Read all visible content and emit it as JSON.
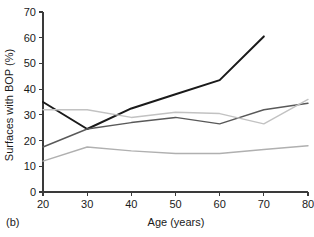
{
  "panel": {
    "label": "(b)"
  },
  "chart_data": {
    "type": "line",
    "title": "",
    "xlabel": "Age (years)",
    "ylabel": "Surfaces with BOP (%)",
    "xlim": [
      20,
      80
    ],
    "ylim": [
      0,
      70
    ],
    "xticks": [
      20,
      30,
      40,
      50,
      60,
      70,
      80
    ],
    "xtick_labels": [
      "20",
      "30",
      "40",
      "50",
      "60",
      "70",
      "80"
    ],
    "yticks": [
      0,
      10,
      20,
      30,
      40,
      50,
      60,
      70
    ],
    "ytick_labels": [
      "0",
      "10",
      "20",
      "30",
      "40",
      "50",
      "60",
      "70"
    ],
    "grid": false,
    "legend": "none",
    "series": [
      {
        "name": "series-1-black",
        "color": "#1a1a1a",
        "width": 2.0,
        "x": [
          20,
          30,
          40,
          50,
          60,
          70
        ],
        "values": [
          35.0,
          24.5,
          32.5,
          38.0,
          43.5,
          60.5
        ]
      },
      {
        "name": "series-2-dark-gray",
        "color": "#595959",
        "width": 1.4,
        "x": [
          20,
          30,
          40,
          50,
          60,
          70,
          80
        ],
        "values": [
          17.5,
          24.5,
          27.0,
          29.0,
          26.5,
          32.0,
          34.5
        ]
      },
      {
        "name": "series-3-light-gray-upper",
        "color": "#c2c2c2",
        "width": 1.4,
        "x": [
          20,
          30,
          40,
          50,
          60,
          70,
          80
        ],
        "values": [
          32.0,
          32.0,
          29.0,
          31.0,
          30.5,
          26.5,
          36.0
        ]
      },
      {
        "name": "series-4-light-gray-lower",
        "color": "#b0b0b0",
        "width": 1.4,
        "x": [
          20,
          30,
          40,
          50,
          60,
          70,
          80
        ],
        "values": [
          12.0,
          17.5,
          16.0,
          15.0,
          15.0,
          16.5,
          18.0
        ]
      }
    ]
  }
}
